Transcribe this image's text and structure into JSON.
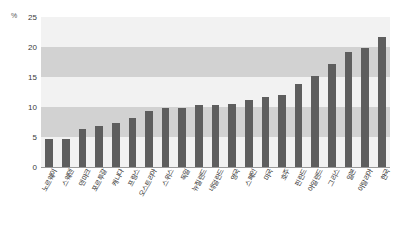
{
  "chart_data": {
    "type": "bar",
    "title": "",
    "subtitle": "",
    "xlabel": "",
    "ylabel": "",
    "unit_label": "%",
    "ylim": [
      0,
      25
    ],
    "yticks": [
      0,
      5,
      10,
      15,
      20,
      25
    ],
    "ytick_labels": [
      "0",
      "5",
      "10",
      "15",
      "20",
      "25"
    ],
    "grid": false,
    "banded_background": true,
    "legend": null,
    "legend_position": "none",
    "bar_color": "#5e5e5e",
    "plot_background": "#f2f2f2",
    "band_color": "#d2d2d2",
    "categories": [
      "노르웨이",
      "스웨덴",
      "덴마크",
      "포르투갈",
      "캐나다",
      "프랑스",
      "오스트리아",
      "스위스",
      "독일",
      "뉴질랜드",
      "네덜란드",
      "영국",
      "스페인",
      "미국",
      "호주",
      "핀란드",
      "아일랜드",
      "그리스",
      "일본",
      "이탈리아",
      "한국"
    ],
    "values": [
      4.7,
      4.7,
      6.3,
      6.9,
      7.4,
      8.1,
      9.3,
      9.8,
      9.9,
      10.3,
      10.4,
      10.5,
      11.1,
      11.6,
      12.0,
      13.8,
      15.2,
      17.2,
      19.1,
      19.9,
      21.7
    ]
  }
}
